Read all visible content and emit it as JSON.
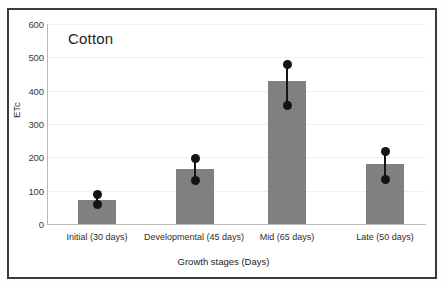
{
  "chart_data": {
    "type": "bar",
    "title": "Cotton",
    "xlabel": "Growth stages (Days)",
    "ylabel": "ETc",
    "ylim": [
      0,
      600
    ],
    "yticks": [
      0,
      100,
      200,
      300,
      400,
      500,
      600
    ],
    "ytick_labels": [
      "0",
      "100",
      "200",
      "300",
      "400",
      "500",
      "600"
    ],
    "grid": true,
    "legend": "none",
    "bar_color": "#808080",
    "error_color": "#141414",
    "categories": [
      "Initial (30 days)",
      "Developmental (45 days)",
      "Mid (65 days)",
      "Late (50 days)"
    ],
    "values": [
      73,
      165,
      428,
      180
    ],
    "error_low": [
      60,
      132,
      357,
      135
    ],
    "error_high": [
      90,
      197,
      478,
      218
    ],
    "series": [
      {
        "name": "ETc",
        "values": [
          73,
          165,
          428,
          180
        ]
      }
    ]
  },
  "axis": {
    "y_title": "ETc",
    "x_title": "Growth stages (Days)",
    "y_labels": [
      "600",
      "500",
      "400",
      "300",
      "200",
      "100",
      "0"
    ],
    "x_labels": [
      "Initial (30 days)",
      "Developmental (45 days)",
      "Mid (65 days)",
      "Late (50 days)"
    ]
  },
  "title": {
    "text": "Cotton"
  }
}
